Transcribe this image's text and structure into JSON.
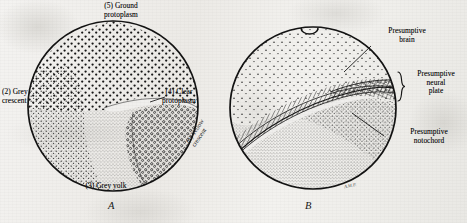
{
  "figure": {
    "background_color": "#f0efed",
    "ink_color": "#141414",
    "panels": [
      {
        "id": "A",
        "letter": "A",
        "labels": [
          {
            "key": "ground_protoplasm",
            "text": "(5) Ground\nprotoplasm"
          },
          {
            "key": "grey_crescent",
            "text": "(2) Grey\ncrescent"
          },
          {
            "key": "clear_protoplasm",
            "text": "(4) Clear\nprotoplasm"
          },
          {
            "key": "yellow_crescent",
            "text": "(1) Yellow\ncrescent"
          },
          {
            "key": "grey_yolk",
            "text": "(3) Grey yolk"
          }
        ]
      },
      {
        "id": "B",
        "letter": "B",
        "labels": [
          {
            "key": "presumptive_brain",
            "text": "Presumptive\nbrain"
          },
          {
            "key": "presumptive_neural_plate",
            "text": "Presumptive\nneural\nplate"
          },
          {
            "key": "presumptive_notochord",
            "text": "Presumptive\nnotochord"
          }
        ],
        "signature": "A.M.P."
      }
    ]
  }
}
